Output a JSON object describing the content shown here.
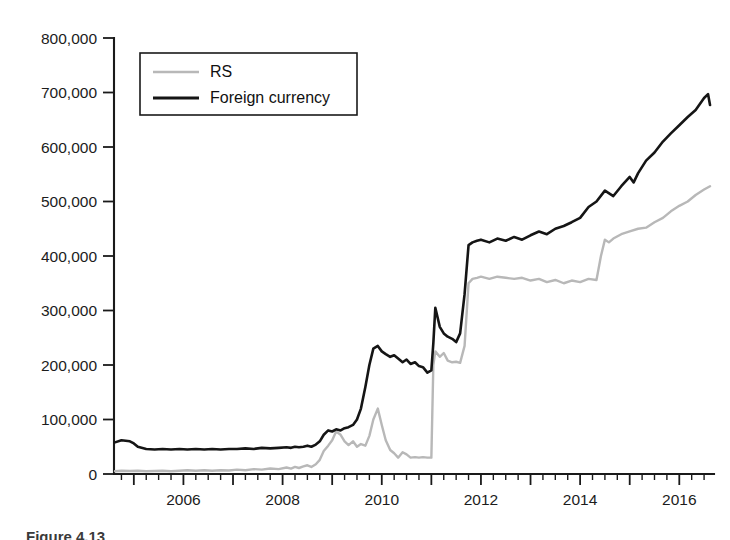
{
  "figure": {
    "caption_partial": "Figure 4.13",
    "background_color": "#ffffff"
  },
  "chart_data": {
    "type": "line",
    "title": "",
    "subtitle": "",
    "xlabel": "",
    "ylabel": "",
    "grid": false,
    "legend_position": "top-left-inside",
    "xlim": [
      2004.6,
      2016.7
    ],
    "ylim": [
      0,
      800000
    ],
    "y_ticks": [
      0,
      100000,
      200000,
      300000,
      400000,
      500000,
      600000,
      700000,
      800000
    ],
    "y_tick_labels": [
      "0",
      "100,000",
      "200,000",
      "300,000",
      "400,000",
      "500,000",
      "600,000",
      "700,000",
      "800,000"
    ],
    "x_ticks_major": [
      2006,
      2008,
      2010,
      2012,
      2014,
      2016
    ],
    "x_tick_labels": [
      "2006",
      "2008",
      "2010",
      "2012",
      "2014",
      "2016"
    ],
    "x_minor_tick_interval": 0.25,
    "series": [
      {
        "name": "RS",
        "color": "#b8b8b8",
        "stroke_width": 2.4,
        "x": [
          2004.62,
          2004.75,
          2004.92,
          2005.08,
          2005.25,
          2005.42,
          2005.58,
          2005.75,
          2005.92,
          2006.08,
          2006.25,
          2006.42,
          2006.58,
          2006.75,
          2006.92,
          2007.08,
          2007.25,
          2007.42,
          2007.58,
          2007.75,
          2007.92,
          2008.08,
          2008.17,
          2008.25,
          2008.33,
          2008.42,
          2008.5,
          2008.58,
          2008.67,
          2008.75,
          2008.83,
          2008.92,
          2009.0,
          2009.08,
          2009.17,
          2009.25,
          2009.33,
          2009.42,
          2009.5,
          2009.58,
          2009.67,
          2009.75,
          2009.83,
          2009.92,
          2010.0,
          2010.08,
          2010.17,
          2010.25,
          2010.33,
          2010.42,
          2010.5,
          2010.58,
          2010.67,
          2010.75,
          2010.83,
          2010.92,
          2011.0,
          2011.04,
          2011.08,
          2011.17,
          2011.25,
          2011.33,
          2011.42,
          2011.5,
          2011.58,
          2011.67,
          2011.75,
          2011.83,
          2011.92,
          2012.0,
          2012.17,
          2012.33,
          2012.5,
          2012.67,
          2012.83,
          2013.0,
          2013.17,
          2013.33,
          2013.5,
          2013.67,
          2013.83,
          2014.0,
          2014.17,
          2014.33,
          2014.42,
          2014.5,
          2014.58,
          2014.67,
          2014.83,
          2015.0,
          2015.17,
          2015.33,
          2015.5,
          2015.67,
          2015.83,
          2016.0,
          2016.17,
          2016.33,
          2016.5,
          2016.62
        ],
        "values": [
          5000,
          6000,
          5500,
          6000,
          5000,
          5500,
          6000,
          5000,
          6000,
          7000,
          6000,
          7000,
          6000,
          7000,
          6500,
          8000,
          7000,
          9000,
          8000,
          10000,
          9000,
          12000,
          10000,
          13000,
          11000,
          14000,
          16000,
          13000,
          18000,
          26000,
          42000,
          52000,
          62000,
          78000,
          72000,
          60000,
          53000,
          60000,
          50000,
          55000,
          52000,
          70000,
          100000,
          120000,
          90000,
          62000,
          44000,
          38000,
          30000,
          40000,
          36000,
          30000,
          31000,
          30000,
          31000,
          30000,
          30000,
          200000,
          225000,
          215000,
          222000,
          208000,
          205000,
          206000,
          204000,
          235000,
          350000,
          358000,
          360000,
          362000,
          358000,
          362000,
          360000,
          358000,
          360000,
          355000,
          358000,
          352000,
          356000,
          350000,
          355000,
          352000,
          358000,
          356000,
          400000,
          430000,
          425000,
          432000,
          440000,
          445000,
          450000,
          452000,
          462000,
          470000,
          482000,
          492000,
          500000,
          512000,
          522000,
          528000
        ]
      },
      {
        "name": "Foreign currency",
        "color": "#151515",
        "stroke_width": 2.6,
        "x": [
          2004.62,
          2004.75,
          2004.92,
          2005.0,
          2005.08,
          2005.25,
          2005.42,
          2005.58,
          2005.75,
          2005.92,
          2006.08,
          2006.25,
          2006.42,
          2006.58,
          2006.75,
          2006.92,
          2007.08,
          2007.25,
          2007.42,
          2007.58,
          2007.75,
          2007.92,
          2008.08,
          2008.17,
          2008.25,
          2008.33,
          2008.42,
          2008.5,
          2008.58,
          2008.67,
          2008.75,
          2008.83,
          2008.92,
          2009.0,
          2009.08,
          2009.17,
          2009.25,
          2009.33,
          2009.42,
          2009.5,
          2009.58,
          2009.67,
          2009.75,
          2009.83,
          2009.92,
          2010.0,
          2010.08,
          2010.17,
          2010.25,
          2010.33,
          2010.42,
          2010.5,
          2010.58,
          2010.67,
          2010.75,
          2010.83,
          2010.92,
          2011.0,
          2011.04,
          2011.08,
          2011.17,
          2011.25,
          2011.33,
          2011.42,
          2011.5,
          2011.58,
          2011.67,
          2011.75,
          2011.83,
          2011.92,
          2012.0,
          2012.17,
          2012.33,
          2012.5,
          2012.67,
          2012.83,
          2013.0,
          2013.17,
          2013.33,
          2013.5,
          2013.67,
          2013.83,
          2014.0,
          2014.17,
          2014.33,
          2014.5,
          2014.67,
          2014.83,
          2015.0,
          2015.08,
          2015.17,
          2015.33,
          2015.5,
          2015.67,
          2015.83,
          2016.0,
          2016.17,
          2016.33,
          2016.5,
          2016.58,
          2016.62
        ],
        "values": [
          58000,
          62000,
          60000,
          56000,
          50000,
          46000,
          45000,
          46000,
          45000,
          46000,
          45000,
          46000,
          45000,
          46000,
          45000,
          46000,
          46000,
          47000,
          46000,
          48000,
          47000,
          48000,
          49000,
          48000,
          50000,
          49000,
          50000,
          52000,
          50000,
          54000,
          60000,
          72000,
          80000,
          78000,
          82000,
          80000,
          84000,
          86000,
          90000,
          100000,
          120000,
          160000,
          200000,
          230000,
          235000,
          225000,
          220000,
          215000,
          218000,
          212000,
          205000,
          210000,
          202000,
          205000,
          198000,
          196000,
          186000,
          190000,
          240000,
          305000,
          270000,
          258000,
          252000,
          248000,
          242000,
          258000,
          330000,
          420000,
          425000,
          428000,
          430000,
          425000,
          432000,
          428000,
          435000,
          430000,
          438000,
          445000,
          440000,
          450000,
          455000,
          462000,
          470000,
          490000,
          500000,
          520000,
          510000,
          528000,
          545000,
          535000,
          552000,
          575000,
          590000,
          610000,
          625000,
          640000,
          655000,
          668000,
          690000,
          697000,
          677000
        ]
      }
    ]
  },
  "legend": {
    "entries": [
      {
        "label": "RS",
        "color": "#b8b8b8"
      },
      {
        "label": "Foreign currency",
        "color": "#151515"
      }
    ]
  }
}
